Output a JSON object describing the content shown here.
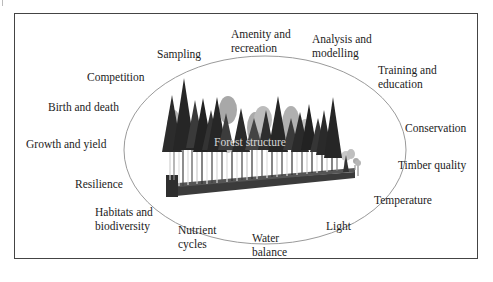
{
  "diagram": {
    "center": {
      "label": "Forest structure"
    },
    "labels": [
      {
        "id": "amenity",
        "line1": "Amenity and",
        "line2": "recreation"
      },
      {
        "id": "analysis",
        "line1": "Analysis and",
        "line2": "modelling"
      },
      {
        "id": "sampling",
        "line1": "Sampling",
        "line2": ""
      },
      {
        "id": "training",
        "line1": "Training and",
        "line2": "education"
      },
      {
        "id": "competition",
        "line1": "Competition",
        "line2": ""
      },
      {
        "id": "birth",
        "line1": "Birth and death",
        "line2": ""
      },
      {
        "id": "conservation",
        "line1": "Conservation",
        "line2": ""
      },
      {
        "id": "growth",
        "line1": "Growth and yield",
        "line2": ""
      },
      {
        "id": "timber",
        "line1": "Timber quality",
        "line2": ""
      },
      {
        "id": "resilience",
        "line1": "Resilience",
        "line2": ""
      },
      {
        "id": "temperature",
        "line1": "Temperature",
        "line2": ""
      },
      {
        "id": "habitats",
        "line1": "Habitats and",
        "line2": "biodiversity"
      },
      {
        "id": "nutrient",
        "line1": "Nutrient",
        "line2": "cycles"
      },
      {
        "id": "light",
        "line1": "Light",
        "line2": ""
      },
      {
        "id": "water",
        "line1": "Water",
        "line2": "balance"
      }
    ],
    "colors": {
      "frame": "#444444",
      "ellipse": "#9a9a9a",
      "tree_dark": "#2a2a2a",
      "tree_mid": "#5a5a5a",
      "tree_light": "#b8b8b8",
      "ground": "#3a3a3a"
    }
  }
}
